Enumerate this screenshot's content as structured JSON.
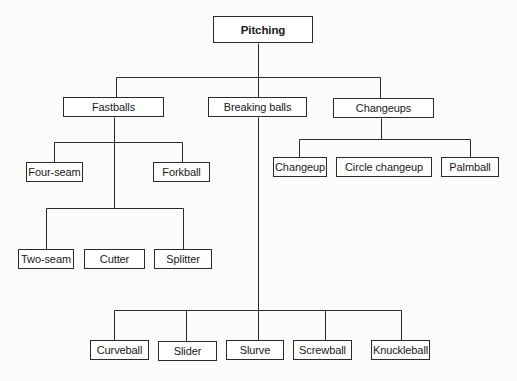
{
  "diagram": {
    "type": "tree",
    "root": {
      "label": "Pitching",
      "box": [
        213,
        16,
        100,
        27
      ]
    },
    "categories": [
      {
        "label": "Fastballs",
        "box": [
          63,
          97,
          101,
          20
        ],
        "children": [
          {
            "label": "Four-seam",
            "box": [
              26,
              162,
              57,
              20
            ]
          },
          {
            "label": "Forkball",
            "box": [
              153,
              162,
              57,
              20
            ]
          },
          {
            "label": "Two-seam",
            "box": [
              18,
              249,
              56,
              20
            ]
          },
          {
            "label": "Cutter",
            "box": [
              84,
              249,
              61,
              20
            ]
          },
          {
            "label": "Splitter",
            "box": [
              154,
              249,
              58,
              20
            ]
          }
        ]
      },
      {
        "label": "Breaking balls",
        "box": [
          208,
          97,
          99,
          20
        ],
        "children": [
          {
            "label": "Curveball",
            "box": [
              90,
              340,
              59,
              20
            ]
          },
          {
            "label": "Slider",
            "box": [
              158,
              341,
              59,
              20
            ]
          },
          {
            "label": "Slurve",
            "box": [
              226,
              340,
              58,
              20
            ]
          },
          {
            "label": "Screwball",
            "box": [
              293,
              340,
              59,
              20
            ]
          },
          {
            "label": "Knuckleball",
            "box": [
              371,
              340,
              59,
              20
            ]
          }
        ]
      },
      {
        "label": "Changeups",
        "box": [
          333,
          98,
          101,
          20
        ],
        "children": [
          {
            "label": "Changeup",
            "box": [
              273,
              157,
              54,
              20
            ]
          },
          {
            "label": "Circle changeup",
            "box": [
              336,
              157,
              96,
              20
            ]
          },
          {
            "label": "Palmball",
            "box": [
              441,
              157,
              58,
              20
            ]
          }
        ]
      }
    ],
    "connectors": [
      {
        "from": [
          258,
          43
        ],
        "to": [
          258,
          77
        ]
      },
      {
        "from": [
          116,
          77
        ],
        "to": [
          380,
          77
        ]
      },
      {
        "from": [
          116,
          77
        ],
        "to": [
          116,
          97
        ]
      },
      {
        "from": [
          258,
          77
        ],
        "to": [
          258,
          97
        ]
      },
      {
        "from": [
          380,
          77
        ],
        "to": [
          380,
          98
        ]
      },
      {
        "from": [
          114,
          117
        ],
        "to": [
          114,
          208
        ]
      },
      {
        "from": [
          54,
          142
        ],
        "to": [
          182,
          142
        ]
      },
      {
        "from": [
          54,
          142
        ],
        "to": [
          54,
          162
        ]
      },
      {
        "from": [
          182,
          142
        ],
        "to": [
          182,
          162
        ]
      },
      {
        "from": [
          46,
          208
        ],
        "to": [
          183,
          208
        ]
      },
      {
        "from": [
          46,
          208
        ],
        "to": [
          46,
          249
        ]
      },
      {
        "from": [
          183,
          208
        ],
        "to": [
          183,
          249
        ]
      },
      {
        "from": [
          258,
          117
        ],
        "to": [
          258,
          310
        ]
      },
      {
        "from": [
          114,
          310
        ],
        "to": [
          401,
          310
        ]
      },
      {
        "from": [
          114,
          310
        ],
        "to": [
          114,
          340
        ]
      },
      {
        "from": [
          186,
          310
        ],
        "to": [
          186,
          341
        ]
      },
      {
        "from": [
          258,
          310
        ],
        "to": [
          258,
          340
        ]
      },
      {
        "from": [
          325,
          310
        ],
        "to": [
          325,
          340
        ]
      },
      {
        "from": [
          401,
          310
        ],
        "to": [
          401,
          340
        ]
      },
      {
        "from": [
          381,
          118
        ],
        "to": [
          381,
          139
        ]
      },
      {
        "from": [
          299,
          139
        ],
        "to": [
          470,
          139
        ]
      },
      {
        "from": [
          299,
          139
        ],
        "to": [
          299,
          157
        ]
      },
      {
        "from": [
          470,
          139
        ],
        "to": [
          470,
          157
        ]
      }
    ],
    "colors": {
      "line": "#2a2a2a",
      "box_border": "#2a2a2a",
      "box_fill": "#ffffff",
      "background": "#fbfbfa"
    }
  }
}
